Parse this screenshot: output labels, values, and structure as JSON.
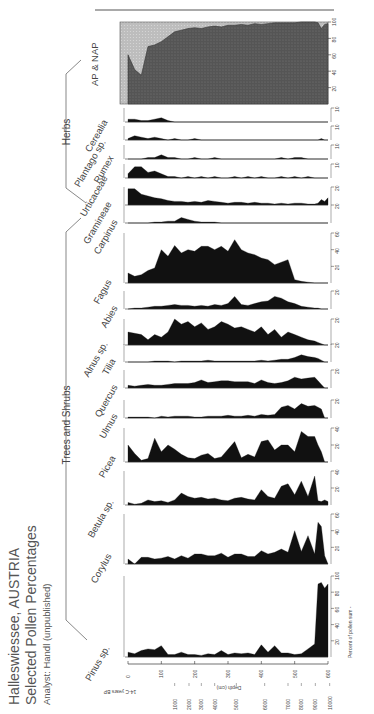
{
  "title": {
    "line1": "Halleswiessee, AUSTRIA",
    "line2": "Selected Pollen Percentages",
    "line3": "Analyst: Handl (unpublished)"
  },
  "groups": [
    {
      "label": "Trees and Shrubs"
    },
    {
      "label": "Herbs"
    }
  ],
  "axes": {
    "depth_label": "Depth (cm)",
    "depth_ticks": [
      "0",
      "100",
      "200",
      "300",
      "400",
      "500",
      "600"
    ],
    "age_label": "14-C years BP",
    "age_ticks": [
      "1000",
      "2000",
      "3000",
      "4000",
      "5000",
      "6000",
      "7000",
      "8000",
      "9000",
      "10000"
    ],
    "percent_label": "Percent of pollen sum"
  },
  "chart_data": {
    "type": "area",
    "subtitle": "Analyst: Handl (unpublished)",
    "xlabel": "Depth (cm)",
    "ylabel": "Percent of pollen sum",
    "secondary_axis": {
      "label": "14-C years BP",
      "ticks": [
        {
          "age": 1000,
          "depth": 140
        },
        {
          "age": 2000,
          "depth": 183
        },
        {
          "age": 3000,
          "depth": 220
        },
        {
          "age": 4000,
          "depth": 260
        },
        {
          "age": 5000,
          "depth": 325
        },
        {
          "age": 6000,
          "depth": 410
        },
        {
          "age": 7000,
          "depth": 480
        },
        {
          "age": 8000,
          "depth": 520
        },
        {
          "age": 9000,
          "depth": 562
        },
        {
          "age": 10000,
          "depth": 605
        }
      ]
    },
    "x": [
      0,
      20,
      40,
      60,
      80,
      100,
      120,
      140,
      160,
      180,
      200,
      220,
      240,
      260,
      280,
      300,
      320,
      340,
      360,
      380,
      400,
      420,
      440,
      460,
      480,
      500,
      520,
      540,
      560,
      570,
      580,
      590,
      600
    ],
    "xlim": [
      0,
      600
    ],
    "grid": false,
    "series": [
      {
        "name": "Pinus sp.",
        "group": "Trees and Shrubs",
        "ylim": [
          0,
          100
        ],
        "values": [
          6,
          4,
          8,
          10,
          9,
          14,
          3,
          3,
          6,
          3,
          3,
          2,
          4,
          3,
          8,
          3,
          5,
          4,
          5,
          3,
          15,
          6,
          14,
          5,
          5,
          3,
          4,
          10,
          16,
          90,
          92,
          85,
          90
        ]
      },
      {
        "name": "Corylus",
        "group": "Trees and Shrubs",
        "ylim": [
          0,
          60
        ],
        "values": [
          6,
          0,
          8,
          8,
          6,
          7,
          9,
          6,
          10,
          7,
          12,
          12,
          10,
          10,
          13,
          8,
          12,
          12,
          9,
          9,
          16,
          12,
          14,
          18,
          14,
          40,
          15,
          34,
          12,
          50,
          45,
          10,
          0
        ]
      },
      {
        "name": "Betula sp.",
        "group": "Trees and Shrubs",
        "ylim": [
          0,
          40
        ],
        "values": [
          3,
          1,
          2,
          6,
          4,
          5,
          3,
          6,
          14,
          10,
          8,
          9,
          7,
          8,
          6,
          5,
          8,
          9,
          7,
          6,
          18,
          10,
          8,
          22,
          25,
          12,
          28,
          10,
          34,
          5,
          4,
          6,
          4
        ]
      },
      {
        "name": "Picea",
        "group": "Trees and Shrubs",
        "ylim": [
          0,
          40
        ],
        "values": [
          20,
          10,
          2,
          4,
          28,
          12,
          20,
          15,
          9,
          5,
          4,
          8,
          10,
          4,
          6,
          15,
          24,
          5,
          9,
          6,
          24,
          26,
          14,
          20,
          20,
          12,
          36,
          30,
          30,
          20,
          12,
          0,
          0
        ]
      },
      {
        "name": "Ulmus",
        "group": "Trees and Shrubs",
        "ylim": [
          0,
          20
        ],
        "values": [
          1,
          1,
          1,
          1,
          0,
          2,
          1,
          2,
          2,
          2,
          1,
          1,
          2,
          2,
          2,
          3,
          2,
          2,
          3,
          2,
          4,
          3,
          4,
          12,
          14,
          10,
          16,
          13,
          14,
          12,
          10,
          0,
          0
        ]
      },
      {
        "name": "Quercus",
        "group": "Trees and Shrubs",
        "ylim": [
          0,
          20
        ],
        "values": [
          3,
          2,
          3,
          4,
          3,
          3,
          4,
          5,
          5,
          5,
          6,
          9,
          6,
          7,
          8,
          8,
          7,
          7,
          7,
          5,
          9,
          6,
          5,
          6,
          8,
          12,
          10,
          11,
          12,
          8,
          4,
          0,
          0
        ]
      },
      {
        "name": "Tilia",
        "group": "Trees and Shrubs",
        "ylim": [
          0,
          20
        ],
        "values": [
          0,
          0,
          0,
          0,
          1,
          1,
          1,
          0,
          1,
          1,
          1,
          1,
          2,
          1,
          1,
          1,
          1,
          1,
          1,
          1,
          2,
          1,
          2,
          3,
          3,
          5,
          8,
          6,
          5,
          4,
          2,
          0,
          0
        ]
      },
      {
        "name": "Alnus sp.",
        "group": "Trees and Shrubs",
        "ylim": [
          0,
          20
        ],
        "values": [
          10,
          9,
          8,
          4,
          8,
          6,
          10,
          20,
          16,
          18,
          14,
          17,
          12,
          14,
          18,
          16,
          13,
          14,
          12,
          10,
          14,
          8,
          12,
          6,
          10,
          8,
          6,
          4,
          3,
          2,
          1,
          0,
          0
        ]
      },
      {
        "name": "Abies",
        "group": "Trees and Shrubs",
        "ylim": [
          0,
          20
        ],
        "values": [
          0,
          1,
          1,
          2,
          3,
          3,
          4,
          5,
          4,
          4,
          3,
          4,
          3,
          5,
          4,
          6,
          14,
          5,
          4,
          6,
          8,
          9,
          14,
          12,
          8,
          6,
          3,
          2,
          1,
          1,
          0,
          0,
          0
        ]
      },
      {
        "name": "Fagus",
        "group": "Trees and Shrubs",
        "ylim": [
          0,
          60
        ],
        "values": [
          12,
          8,
          10,
          15,
          18,
          40,
          32,
          45,
          36,
          40,
          38,
          44,
          44,
          40,
          44,
          38,
          52,
          40,
          36,
          34,
          30,
          28,
          22,
          25,
          28,
          4,
          2,
          1,
          0,
          0,
          0,
          0,
          0
        ]
      },
      {
        "name": "Carpinus",
        "group": "Trees and Shrubs",
        "ylim": [
          0,
          20
        ],
        "values": [
          0,
          0,
          0,
          0,
          1,
          1,
          2,
          2,
          6,
          4,
          2,
          1,
          1,
          1,
          0,
          0,
          0,
          0,
          0,
          0,
          0,
          0,
          0,
          0,
          0,
          0,
          0,
          0,
          0,
          0,
          0,
          0,
          0
        ]
      },
      {
        "name": "Gramineae",
        "group": "Herbs",
        "ylim": [
          0,
          20
        ],
        "values": [
          18,
          18,
          12,
          10,
          8,
          7,
          5,
          4,
          4,
          3,
          4,
          3,
          5,
          4,
          3,
          2,
          3,
          3,
          2,
          3,
          2,
          2,
          1,
          2,
          1,
          2,
          2,
          1,
          1,
          2,
          6,
          4,
          8
        ]
      },
      {
        "name": "Urticaceae",
        "group": "Herbs",
        "ylim": [
          0,
          10
        ],
        "values": [
          3,
          8,
          8,
          4,
          5,
          3,
          1,
          1,
          0,
          1,
          0,
          1,
          0,
          1,
          0,
          0,
          1,
          0,
          1,
          0,
          1,
          0,
          0,
          1,
          0,
          1,
          0,
          1,
          0,
          0,
          0,
          0,
          0
        ]
      },
      {
        "name": "Rumex",
        "group": "Herbs",
        "ylim": [
          0,
          10
        ],
        "values": [
          0,
          0,
          0,
          1,
          1,
          3,
          1,
          1,
          0,
          0,
          1,
          0,
          0,
          1,
          0,
          0,
          0,
          0,
          0,
          0,
          0,
          0,
          0,
          1,
          0,
          1,
          1,
          0,
          0,
          0,
          0,
          0,
          0
        ]
      },
      {
        "name": "Plantago sp.",
        "group": "Herbs",
        "ylim": [
          0,
          10
        ],
        "values": [
          1,
          3,
          2,
          1,
          2,
          1,
          0,
          1,
          0,
          0,
          1,
          0,
          0,
          0,
          0,
          0,
          0,
          0,
          0,
          0,
          0,
          0,
          0,
          0,
          0,
          0,
          0,
          0,
          0,
          0,
          1,
          0,
          0
        ]
      },
      {
        "name": "Cerealia",
        "group": "Herbs",
        "ylim": [
          0,
          10
        ],
        "values": [
          2,
          2,
          1,
          1,
          2,
          3,
          1,
          0,
          0,
          0,
          0,
          0,
          0,
          0,
          0,
          0,
          0,
          0,
          0,
          0,
          0,
          0,
          0,
          0,
          0,
          0,
          0,
          0,
          0,
          0,
          0,
          0,
          0
        ]
      },
      {
        "name": "AP & NAP",
        "group": "Summary",
        "ylim": [
          0,
          100
        ],
        "values": [
          60,
          42,
          35,
          70,
          72,
          76,
          82,
          88,
          90,
          92,
          93,
          92,
          94,
          95,
          94,
          96,
          96,
          97,
          96,
          98,
          97,
          98,
          99,
          99,
          99,
          99,
          100,
          100,
          100,
          99,
          92,
          97,
          98
        ]
      }
    ],
    "legend": {
      "position": "none"
    }
  }
}
